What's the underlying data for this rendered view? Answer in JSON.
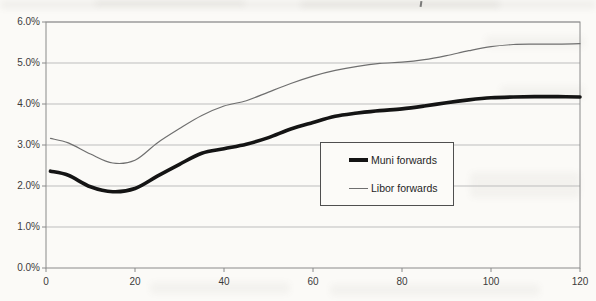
{
  "page": {
    "background": "#fbfaf7"
  },
  "chart_data": {
    "type": "line",
    "title": "",
    "xlabel": "",
    "ylabel": "",
    "xlim": [
      0,
      120
    ],
    "ylim": [
      0,
      6
    ],
    "x_ticks": [
      0,
      20,
      40,
      60,
      80,
      100,
      120
    ],
    "y_ticks": [
      0,
      1,
      2,
      3,
      4,
      5,
      6
    ],
    "y_tick_format": "percent-1dp",
    "grid": "horizontal",
    "legend_position": "inside-center-right-box",
    "x": [
      1,
      5,
      10,
      15,
      20,
      25,
      30,
      35,
      40,
      45,
      50,
      55,
      60,
      65,
      70,
      75,
      80,
      85,
      90,
      95,
      100,
      105,
      110,
      115,
      120
    ],
    "series": [
      {
        "name": "Muni forwards",
        "color": "#141414",
        "stroke_width": 3.6,
        "values": [
          2.36,
          2.26,
          1.98,
          1.86,
          1.94,
          2.24,
          2.53,
          2.8,
          2.91,
          3.02,
          3.18,
          3.39,
          3.55,
          3.7,
          3.78,
          3.84,
          3.88,
          3.95,
          4.03,
          4.1,
          4.15,
          4.17,
          4.18,
          4.18,
          4.17
        ]
      },
      {
        "name": "Libor forwards",
        "color": "#6f6f6f",
        "stroke_width": 1.2,
        "values": [
          3.16,
          3.05,
          2.78,
          2.56,
          2.63,
          3.05,
          3.4,
          3.72,
          3.95,
          4.08,
          4.29,
          4.5,
          4.68,
          4.82,
          4.92,
          4.99,
          5.02,
          5.08,
          5.18,
          5.3,
          5.4,
          5.45,
          5.46,
          5.46,
          5.47
        ]
      }
    ],
    "axis_style": {
      "axis_color": "#8a8a8a",
      "grid_color": "#bdbdbd",
      "label_color": "#3b3b3b"
    }
  }
}
